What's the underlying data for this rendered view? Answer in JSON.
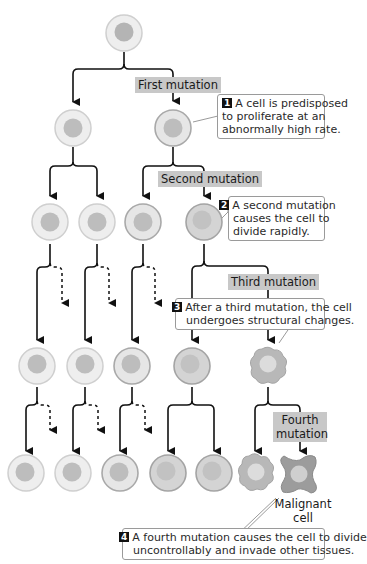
{
  "diagram": {
    "topic": "Multistep development of cancer",
    "colors": {
      "normal_cell_fill": "#eeeeee",
      "normal_cell_stroke": "#cfcfcf",
      "nucleus": "#bdbdbd",
      "mutated_cell_fill": "#dedede",
      "mutated_cell_stroke": "#a9a9a9",
      "jagged_cell_fill": "#b8b8b8",
      "malignant_cell_fill": "#a0a0a0",
      "label_bg": "#c8c8c8",
      "arrow": "#111111"
    },
    "mutation_labels": [
      {
        "id": "first",
        "text": "First mutation"
      },
      {
        "id": "second",
        "text": "Second mutation"
      },
      {
        "id": "third",
        "text": "Third mutation"
      },
      {
        "id": "fourth",
        "line1": "Fourth",
        "line2": "mutation"
      }
    ],
    "callouts": [
      {
        "number": "1",
        "lines": [
          "A cell is predisposed",
          "to proliferate at an",
          "abnormally high rate."
        ]
      },
      {
        "number": "2",
        "lines": [
          "A second mutation",
          "causes the cell to",
          "divide rapidly."
        ]
      },
      {
        "number": "3",
        "lines": [
          "After a third mutation, the cell",
          "undergoes structural changes."
        ]
      },
      {
        "number": "4",
        "lines": [
          "A fourth mutation causes the cell to divide",
          "uncontrollably and invade other tissues."
        ]
      }
    ],
    "malignant_label": {
      "line1": "Malignant",
      "line2": "cell"
    },
    "rows": [
      {
        "row": 1,
        "cells": [
          "normal"
        ]
      },
      {
        "row": 2,
        "cells": [
          "normal",
          "first-mutation"
        ]
      },
      {
        "row": 3,
        "cells": [
          "normal",
          "normal",
          "first-mutation",
          "second-mutation"
        ]
      },
      {
        "row": 4,
        "cells": [
          "normal",
          "normal",
          "first-mutation",
          "second-mutation",
          "third-mutation"
        ]
      },
      {
        "row": 5,
        "cells": [
          "normal",
          "normal",
          "first-mutation",
          "second-mutation",
          "second-mutation",
          "third-mutation",
          "malignant"
        ]
      }
    ]
  }
}
